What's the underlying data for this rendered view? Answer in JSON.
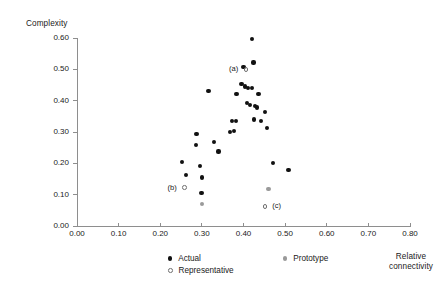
{
  "chart_data": {
    "type": "scatter",
    "title": "",
    "xlabel": "Relative\nconnectivity",
    "ylabel": "Complexity",
    "xlim": [
      0.0,
      0.8
    ],
    "ylim": [
      0.0,
      0.6
    ],
    "grid": false,
    "legend_position": "bottom",
    "x_ticks": [
      "0.00",
      "0.10",
      "0.20",
      "0.30",
      "0.40",
      "0.50",
      "0.60",
      "0.70",
      "0.80"
    ],
    "x_tick_values": [
      0.0,
      0.1,
      0.2,
      0.3,
      0.4,
      0.5,
      0.6,
      0.7,
      0.8
    ],
    "y_ticks": [
      "0.00",
      "0.10",
      "0.20",
      "0.30",
      "0.40",
      "0.50",
      "0.60"
    ],
    "y_tick_values": [
      0.0,
      0.1,
      0.2,
      0.3,
      0.4,
      0.5,
      0.6
    ],
    "legend": [
      {
        "name": "Actual",
        "marker": "filled-circle",
        "color": "#111111"
      },
      {
        "name": "Representative",
        "marker": "open-circle",
        "color": "#6f6f6f"
      },
      {
        "name": "Prototype",
        "marker": "filled-circle",
        "color": "#9a9a9a"
      }
    ],
    "series": [
      {
        "name": "Actual",
        "marker": "filled-circle",
        "color": "#111111",
        "points": [
          [
            0.252,
            0.203
          ],
          [
            0.261,
            0.162
          ],
          [
            0.287,
            0.293
          ],
          [
            0.286,
            0.259
          ],
          [
            0.296,
            0.191
          ],
          [
            0.3,
            0.155
          ],
          [
            0.299,
            0.105
          ],
          [
            0.316,
            0.43
          ],
          [
            0.33,
            0.268
          ],
          [
            0.34,
            0.238
          ],
          [
            0.368,
            0.3
          ],
          [
            0.373,
            0.335
          ],
          [
            0.382,
            0.334
          ],
          [
            0.378,
            0.303
          ],
          [
            0.383,
            0.421
          ],
          [
            0.395,
            0.452
          ],
          [
            0.4,
            0.507
          ],
          [
            0.404,
            0.445
          ],
          [
            0.411,
            0.441
          ],
          [
            0.409,
            0.393
          ],
          [
            0.416,
            0.385
          ],
          [
            0.42,
            0.596
          ],
          [
            0.424,
            0.522
          ],
          [
            0.42,
            0.44
          ],
          [
            0.428,
            0.383
          ],
          [
            0.425,
            0.34
          ],
          [
            0.433,
            0.378
          ],
          [
            0.436,
            0.421
          ],
          [
            0.443,
            0.336
          ],
          [
            0.452,
            0.363
          ],
          [
            0.456,
            0.312
          ],
          [
            0.47,
            0.201
          ],
          [
            0.508,
            0.18
          ]
        ]
      },
      {
        "name": "Representative",
        "marker": "open-circle",
        "color": "#6f6f6f",
        "points": [
          [
            0.258,
            0.122
          ],
          [
            0.406,
            0.5
          ],
          [
            0.452,
            0.063
          ]
        ]
      },
      {
        "name": "Prototype",
        "marker": "filled-circle",
        "color": "#9a9a9a",
        "points": [
          [
            0.3,
            0.07
          ],
          [
            0.46,
            0.118
          ]
        ]
      }
    ],
    "annotations": [
      {
        "label": "(a)",
        "x": 0.406,
        "y": 0.5,
        "dx": -17,
        "dy": -5
      },
      {
        "label": "(b)",
        "x": 0.258,
        "y": 0.122,
        "dx": -17,
        "dy": -5
      },
      {
        "label": "(c)",
        "x": 0.452,
        "y": 0.063,
        "dx": 7,
        "dy": -5
      }
    ]
  }
}
